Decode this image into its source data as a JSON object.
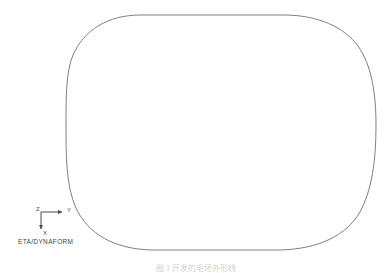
{
  "figure": {
    "kind": "cad-outline-view",
    "background_color": "#ffffff",
    "line_color": "#808080",
    "line_width": 1
  },
  "outline": {
    "name": "blank-outline-curve",
    "shape": "rounded-rectangle",
    "bounds": {
      "left": 66,
      "top": 15,
      "right": 376,
      "bottom": 250
    },
    "corner_radius": 74
  },
  "triad": {
    "origin_label": "Z",
    "horizontal_label": "Y",
    "vertical_label": "X",
    "color": "#4a4a4a"
  },
  "brand": {
    "text": "ETA/DYNAFORM"
  },
  "caption": {
    "text": "图 1  开发的毛坯外形线"
  }
}
